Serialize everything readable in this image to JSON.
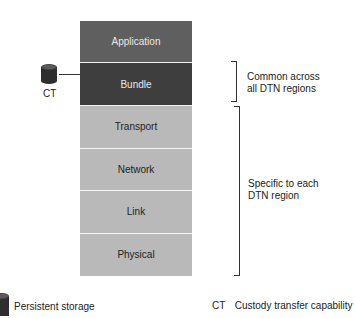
{
  "diagram": {
    "layers": [
      {
        "label": "Application",
        "fill": "#5f5f5f",
        "text_color": "#e8e8e8"
      },
      {
        "label": "Bundle",
        "fill": "#3e3e3e",
        "text_color": "#e8e8e8"
      },
      {
        "label": "Transport",
        "fill": "#b9b9b9",
        "text_color": "#222222"
      },
      {
        "label": "Network",
        "fill": "#b9b9b9",
        "text_color": "#222222"
      },
      {
        "label": "Link",
        "fill": "#b9b9b9",
        "text_color": "#222222"
      },
      {
        "label": "Physical",
        "fill": "#b9b9b9",
        "text_color": "#222222"
      }
    ],
    "storage_node": {
      "label": "CT",
      "icon": "cylinder-storage-icon"
    },
    "brackets": [
      {
        "line1": "Common across",
        "line2": "all DTN regions"
      },
      {
        "line1": "Specific to each",
        "line2": "DTN region"
      }
    ],
    "legend": {
      "storage_label": "Persistent storage",
      "ct_abbrev": "CT",
      "ct_label": "Custody transfer capability"
    }
  }
}
